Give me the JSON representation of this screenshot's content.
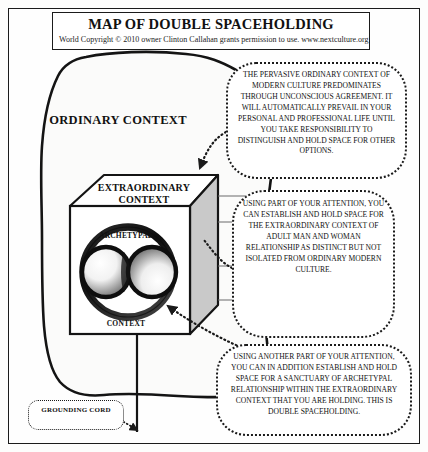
{
  "document": {
    "title": "MAP OF DOUBLE SPACEHOLDING",
    "copyright": "World Copyright © 2010 owner Clinton Callahan grants permission to use. www.nextculture.org"
  },
  "diagram": {
    "type": "concept-map",
    "labels": {
      "ordinary_context": "ORDINARY CONTEXT",
      "extraordinary_context": "EXTRAORDINARY CONTEXT",
      "archetypal_top": "ARCHETYPAL",
      "archetypal_bottom": "CONTEXT",
      "grounding_cord": "GROUNDING CORD"
    },
    "colors": {
      "ink": "#1b1b1b",
      "paper": "#fefefe",
      "cube_shade": "#c9c9c9",
      "cube_face": "#ffffff"
    }
  },
  "callouts": [
    {
      "id": "callout-ordinary",
      "target": "ordinary-context",
      "text": "THE PERVASIVE ORDINARY CONTEXT OF MODERN CULTURE PREDOMINATES THROUGH UNCONSCIOUS AGREEMENT. IT WILL AUTOMATICALLY PREVAIL IN YOUR PERSONAL AND PROFESSIONAL LIFE UNTIL YOU TAKE RESPONSIBILITY TO DISTINGUISH AND HOLD SPACE FOR OTHER OPTIONS."
    },
    {
      "id": "callout-extraordinary",
      "target": "extraordinary-context",
      "text": "USING PART OF YOUR ATTENTION, YOU CAN ESTABLISH AND HOLD SPACE FOR THE EXTRAORDINARY CONTEXT OF ADULT MAN AND WOMAN RELATIONSHIP AS DISTINCT BUT NOT ISOLATED FROM ORDINARY MODERN CULTURE."
    },
    {
      "id": "callout-double",
      "target": "archetypal-context",
      "text": "USING ANOTHER PART OF YOUR ATTENTION, YOU CAN IN ADDITION ESTABLISH AND HOLD SPACE FOR A SANCTUARY OF ARCHETYPAL RELATIONSHIP WITHIN THE EXTRAORDINARY CONTEXT THAT YOU ARE HOLDING. THIS IS DOUBLE SPACEHOLDING."
    }
  ]
}
